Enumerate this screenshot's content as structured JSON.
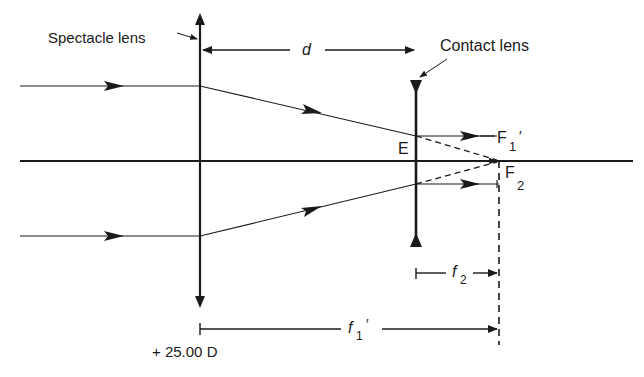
{
  "labels": {
    "spectacle_lens": "Spectacle lens",
    "contact_lens": "Contact lens",
    "distance": "d",
    "vertex_point": "E",
    "focal_point_1_main": "F",
    "focal_point_1_sub": "1",
    "focal_point_1_prime": "′",
    "focal_point_2_main": "F",
    "focal_point_2_sub": "2",
    "focal_length_2_main": "f",
    "focal_length_2_sub": "2",
    "focal_length_1_main": "f",
    "focal_length_1_sub": "1",
    "focal_length_1_prime": "′",
    "spectacle_power": "+ 25.00 D"
  },
  "colors": {
    "ink": "#1a1a1a",
    "background": "#ffffff"
  }
}
